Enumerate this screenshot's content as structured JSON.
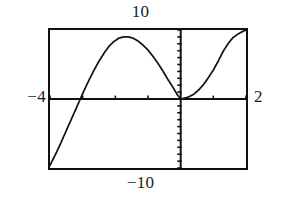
{
  "figure": {
    "title": "",
    "caption": "",
    "window_labels": {
      "ymax": "10",
      "ymin": "−10",
      "xmin": "−4",
      "xmax": "2"
    }
  },
  "chart_data": {
    "type": "line",
    "title": "",
    "subtitle": "",
    "xlabel": "",
    "ylabel": "",
    "xlim": [
      -4,
      2
    ],
    "ylim": [
      -10,
      10
    ],
    "grid": false,
    "legend": null,
    "legend_position": "none",
    "axis_style": "calculator-window-with-tick-marks",
    "x_axis_position": 0,
    "y_axis_position": 0,
    "x_tick_spacing": 1,
    "y_tick_spacing": 1,
    "x_ticks": [
      -4,
      -3,
      -2,
      -1,
      0,
      1,
      2
    ],
    "y_ticks": [
      -10,
      -9,
      -8,
      -7,
      -6,
      -5,
      -4,
      -3,
      -2,
      -1,
      0,
      1,
      2,
      3,
      4,
      5,
      6,
      7,
      8,
      9,
      10
    ],
    "tick_labels_shown": false,
    "annotations": [
      {
        "text": "10",
        "position": "top-outside",
        "meaning": "window Ymax"
      },
      {
        "text": "−10",
        "position": "bottom-outside",
        "meaning": "window Ymin"
      },
      {
        "text": "−4",
        "position": "left-outside",
        "meaning": "window Xmin"
      },
      {
        "text": "2",
        "position": "right-outside",
        "meaning": "window Xmax"
      }
    ],
    "series": [
      {
        "name": "curve",
        "style": "dotted-pixel-trace",
        "color": "#111111",
        "description": "Cubic-like curve: enters at lower-left below the window, rises steeply crossing the x-axis near x = -3.3, reaches a local maximum of about y = 9 near x = -2.3, decreases to touch the x-axis at a double root near x = 0, then increases steeply and exits the top-right of the window.",
        "x": [
          -4.0,
          -3.85,
          -3.7,
          -3.55,
          -3.4,
          -3.25,
          -3.1,
          -2.95,
          -2.8,
          -2.65,
          -2.5,
          -2.35,
          -2.2,
          -2.05,
          -1.9,
          -1.75,
          -1.6,
          -1.45,
          -1.3,
          -1.15,
          -1.0,
          -0.85,
          -0.7,
          -0.55,
          -0.4,
          -0.25,
          -0.1,
          0.0,
          0.1,
          0.25,
          0.4,
          0.55,
          0.7,
          0.85,
          1.0,
          1.15,
          1.3,
          1.45,
          1.6,
          1.75,
          1.9,
          2.0
        ],
        "y": [
          -9.6,
          -8.2,
          -6.7,
          -5.1,
          -3.5,
          -1.9,
          -0.3,
          1.3,
          2.8,
          4.2,
          5.5,
          6.6,
          7.6,
          8.3,
          8.8,
          9.0,
          9.0,
          8.8,
          8.4,
          7.8,
          7.1,
          6.2,
          5.2,
          4.1,
          2.9,
          1.8,
          0.6,
          0.0,
          0.1,
          0.3,
          0.7,
          1.3,
          2.1,
          3.1,
          4.2,
          5.5,
          6.9,
          8.0,
          8.9,
          9.4,
          9.8,
          10.0
        ],
        "key_points": [
          {
            "label": "x-intercept",
            "x": -3.3,
            "y": 0
          },
          {
            "label": "local maximum",
            "x": -2.3,
            "y": 9.0
          },
          {
            "label": "double root / local minimum",
            "x": 0.0,
            "y": 0.0
          }
        ]
      }
    ]
  }
}
